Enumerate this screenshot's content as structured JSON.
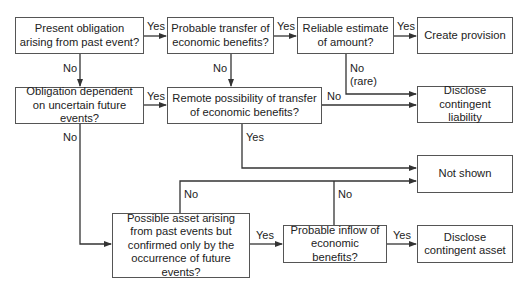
{
  "nodes": {
    "present_obligation": "Present obligation arising from past event?",
    "probable_transfer": "Probable transfer of economic benefits?",
    "reliable_estimate": "Reliable estimate of amount?",
    "create_provision": "Create provision",
    "obligation_dependent": "Obligation dependent on uncertain future events?",
    "remote_possibility": "Remote possibility of transfer of economic benefits?",
    "disclose_liability": "Disclose contingent liability",
    "not_shown": "Not shown",
    "possible_asset": "Possible asset arising from past events but confirmed only by the occurrence of future events?",
    "probable_inflow": "Probable inflow of economic benefits?",
    "disclose_asset": "Disclose contingent asset"
  },
  "edges": {
    "e1_yes": "Yes",
    "e2_yes": "Yes",
    "e3_yes": "Yes",
    "e1_no": "No",
    "e2_no": "No",
    "e3_no": "No",
    "e3_no_note": "(rare)",
    "e5_yes": "Yes",
    "e5_no": "No",
    "e6_no": "No",
    "e6_yes": "Yes",
    "e8_no": "No",
    "e8_yes": "Yes",
    "e9_no": "No",
    "e9_yes": "Yes"
  },
  "colors": {
    "line": "#333333",
    "border": "#555555"
  }
}
